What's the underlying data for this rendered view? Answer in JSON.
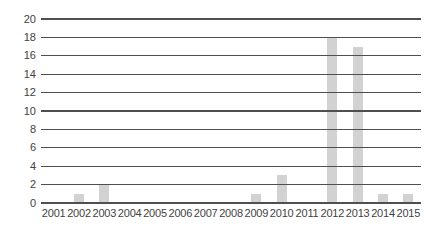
{
  "chart_data": {
    "type": "bar",
    "categories": [
      "2001",
      "2002",
      "2003",
      "2004",
      "2005",
      "2006",
      "2007",
      "2008",
      "2009",
      "2010",
      "2011",
      "2012",
      "2013",
      "2014",
      "2015"
    ],
    "values": [
      0,
      1,
      2,
      0,
      0,
      0,
      0,
      0,
      1,
      3,
      0,
      18,
      17,
      1,
      1
    ],
    "title": "",
    "xlabel": "",
    "ylabel": "",
    "ylim": [
      0,
      20
    ],
    "yticks": [
      0,
      2,
      4,
      6,
      8,
      10,
      12,
      14,
      16,
      18,
      20
    ],
    "grid": "horizontal",
    "gridlines_over_bars": true,
    "legend_position": "none",
    "bar_color": "#d2d2d2",
    "gridline_color": "#4f4f4f",
    "label_color": "#3f3f3f",
    "background_color": "#ffffff"
  }
}
